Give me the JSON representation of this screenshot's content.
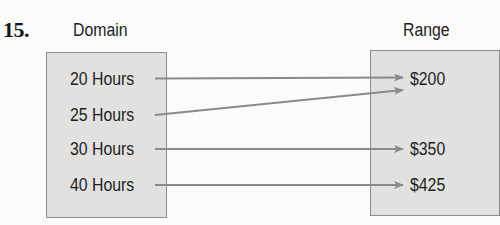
{
  "problem": {
    "number": "15."
  },
  "domain": {
    "title": "Domain",
    "items": [
      "20 Hours",
      "25 Hours",
      "30 Hours",
      "40 Hours"
    ]
  },
  "range": {
    "title": "Range",
    "items": [
      "$200",
      "$350",
      "$425"
    ]
  },
  "mapping": [
    {
      "from": "20 Hours",
      "to": "$200"
    },
    {
      "from": "25 Hours",
      "to": "$200"
    },
    {
      "from": "30 Hours",
      "to": "$350"
    },
    {
      "from": "40 Hours",
      "to": "$425"
    }
  ],
  "colors": {
    "box_fill": "#e1e1e0",
    "box_border": "#8d8d8d",
    "arrow": "#8a8a8a",
    "text": "#1e1e1e"
  }
}
